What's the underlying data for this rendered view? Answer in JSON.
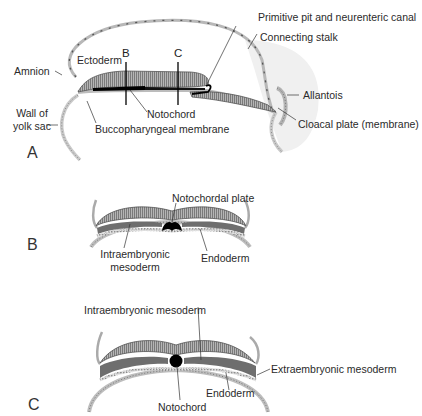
{
  "figure": {
    "panels": [
      {
        "id": "A",
        "letter": "A",
        "view": "sagittal section of embryo",
        "labels": {
          "primitive_pit": "Primitive pit and neurenteric canal",
          "connecting_stalk": "Connecting stalk",
          "amnion": "Amnion",
          "ectoderm": "Ectoderm",
          "cut_b": "B",
          "cut_c": "C",
          "wall_of_yolk_sac_1": "Wall of",
          "wall_of_yolk_sac_2": "yolk sac",
          "notochord": "Notochord",
          "allantois": "Allantois",
          "buccopharyngeal": "Buccopharyngeal membrane",
          "cloacal_plate": "Cloacal plate (membrane)"
        }
      },
      {
        "id": "B",
        "letter": "B",
        "view": "transverse section at level B",
        "labels": {
          "notochordal_plate": "Notochordal plate",
          "intraembryonic_1": "Intraembryonic",
          "intraembryonic_2": "mesoderm",
          "endoderm": "Endoderm"
        }
      },
      {
        "id": "C",
        "letter": "C",
        "view": "transverse section at level C",
        "labels": {
          "intraembryonic_mesoderm": "Intraembryonic mesoderm",
          "extraembryonic_mesoderm": "Extraembryonic mesoderm",
          "endoderm": "Endoderm",
          "notochord": "Notochord"
        }
      }
    ]
  },
  "colors": {
    "ectoderm": "#9a9a9a",
    "mesoderm": "#6e6e6e",
    "endoderm": "#c8c8c8",
    "notochord": "#000000",
    "outline": "#4a4a4a",
    "stalk_shade": "#efefef"
  }
}
